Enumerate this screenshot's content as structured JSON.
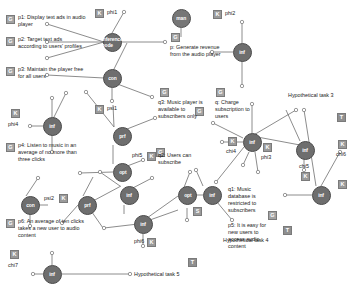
{
  "diagram": {
    "type": "goal-model",
    "title": "",
    "node_kinds": {
      "inf": "inference-node",
      "con": "contribution-node",
      "prf": "preference-node",
      "opt": "option-node",
      "dat": "data-node",
      "man": "mandatory-node"
    },
    "badges": {
      "G": "goal-badge",
      "K": "knowledge-badge",
      "S": "softgoal-badge",
      "T": "task-badge"
    },
    "labels": [
      {
        "id": "p1",
        "text": "p1: Display text ads in audio player"
      },
      {
        "id": "p2",
        "text": "p2: Target text ads according to users' profiles"
      },
      {
        "id": "p3",
        "text": "p3: Maintain the player free for all users"
      },
      {
        "id": "p4",
        "text": "p4: Listen to music in an average of no more than three clicks"
      },
      {
        "id": "p6",
        "text": "p6: An average of ten clicks takes a new user to audio content"
      },
      {
        "id": "p",
        "text": "p: Generate revenue from the audio player"
      },
      {
        "id": "q3",
        "text": "q3: Music player is available to subscribers only"
      },
      {
        "id": "q2",
        "text": "q2: Users can subscribe"
      },
      {
        "id": "q",
        "text": "q: Charge subscription to users"
      },
      {
        "id": "q1",
        "text": "q1: Music database is restricted to subscribers"
      },
      {
        "id": "p5",
        "text": "p5: It is easy for new users to access audio content"
      },
      {
        "id": "ht3",
        "text": "Hypothetical task 3"
      },
      {
        "id": "ht4",
        "text": "Hypothetical task 4"
      },
      {
        "id": "ht5",
        "text": "Hypothetical task 5"
      }
    ],
    "var_labels": [
      {
        "id": "phi1",
        "text": "phi1"
      },
      {
        "id": "phi2",
        "text": "phi2"
      },
      {
        "id": "psi1",
        "text": "psi1"
      },
      {
        "id": "phi4",
        "text": "phi4"
      },
      {
        "id": "phi5",
        "text": "phi5"
      },
      {
        "id": "psi2",
        "text": "psi2"
      },
      {
        "id": "phi6",
        "text": "phi6"
      },
      {
        "id": "chi7",
        "text": "chi7"
      },
      {
        "id": "chi4",
        "text": "chi4"
      },
      {
        "id": "phi3",
        "text": "phi3"
      },
      {
        "id": "chi5",
        "text": "chi5"
      },
      {
        "id": "chi6",
        "text": "chi6"
      }
    ],
    "nodes": [
      {
        "id": "n-inf-1",
        "kind": "inf",
        "x": 103,
        "y": 33
      },
      {
        "id": "n-con-1",
        "kind": "con",
        "x": 103,
        "y": 69
      },
      {
        "id": "n-prf-1",
        "kind": "prf",
        "x": 113,
        "y": 127
      },
      {
        "id": "n-inf-2",
        "kind": "inf",
        "x": 43,
        "y": 117
      },
      {
        "id": "n-opt-1",
        "kind": "opt",
        "x": 113,
        "y": 163
      },
      {
        "id": "n-inf-3",
        "kind": "inf",
        "x": 120,
        "y": 186
      },
      {
        "id": "n-con-2",
        "kind": "con",
        "x": 21,
        "y": 196
      },
      {
        "id": "n-prf-2",
        "kind": "prf",
        "x": 78,
        "y": 196
      },
      {
        "id": "n-inf-4",
        "kind": "inf",
        "x": 138,
        "y": 215
      },
      {
        "id": "n-inf-5",
        "kind": "inf",
        "x": 43,
        "y": 265
      },
      {
        "id": "n-man",
        "kind": "man",
        "x": 172,
        "y": 9
      },
      {
        "id": "n-inf-6",
        "kind": "inf",
        "x": 233,
        "y": 43
      },
      {
        "id": "n-inf-7",
        "kind": "inf",
        "x": 243,
        "y": 133
      },
      {
        "id": "n-inf-8",
        "kind": "inf",
        "x": 300,
        "y": 141
      },
      {
        "id": "n-opt-2",
        "kind": "opt",
        "x": 178,
        "y": 190
      },
      {
        "id": "n-inf-9",
        "kind": "inf",
        "x": 203,
        "y": 186
      },
      {
        "id": "n-inf-10",
        "kind": "inf",
        "x": 312,
        "y": 186
      }
    ]
  }
}
